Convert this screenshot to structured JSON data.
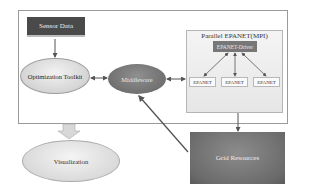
{
  "diagram": {
    "nodes": {
      "sensor_data": "Sensor Data",
      "optimization_toolkit": "Optimization Toolkit",
      "middleware": "Middleware",
      "parallel_epanet_title": "Parallel EPANET(MPI)",
      "epanet_driver": "EPANET-Driver",
      "epanet_workers": [
        "EPANET",
        "EPANET",
        "EPANET"
      ],
      "visualization": "Visualization",
      "grid_resources": "Grid Resources"
    },
    "edges": [
      {
        "from": "Sensor Data",
        "to": "Optimization Toolkit",
        "type": "arrow"
      },
      {
        "from": "Optimization Toolkit",
        "to": "Middleware",
        "type": "bidirectional"
      },
      {
        "from": "Middleware",
        "to": "Parallel EPANET(MPI)",
        "type": "bidirectional"
      },
      {
        "from": "EPANET-Driver",
        "to": "EPANET",
        "type": "bidirectional"
      },
      {
        "from": "Parallel EPANET(MPI)",
        "to": "Grid Resources",
        "type": "arrow"
      },
      {
        "from": "Grid Resources",
        "to": "Middleware",
        "type": "arrow"
      },
      {
        "from": "System",
        "to": "Visualization",
        "type": "block-arrow"
      }
    ]
  }
}
